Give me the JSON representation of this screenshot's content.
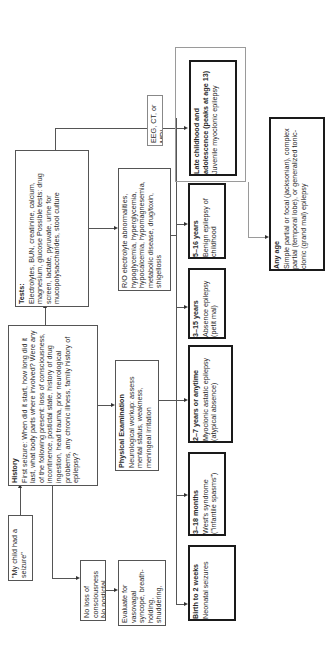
{
  "diagram": {
    "orientation": "rotated 90 degrees counterclockwise",
    "nodes": {
      "start": {
        "text": "\"My child had a seizure\""
      },
      "history": {
        "title": "History",
        "body": "First seizure: When did it start, how long did it last, what body parts where involved? Were any of the following present: loss of consciousness, incontinence, postictal state, history of drug ingestion, head trauma, prior neurological problems, any chronic illness, family history of epilepsy?"
      },
      "tests": {
        "title": "Tests:",
        "body": "Electrolytes, BUN, creatinine, calcium, magnesium, glucose Possible tests: drug screen, lactate, pyruvate, urine for mucopolysaccharides, stool culture"
      },
      "no_loss": {
        "text": "No loss of consciousness No postictal state"
      },
      "evaluate": {
        "text": "Evaluate for vasovagal syncope, breath-holding, shuddering, benign paroxysmal vertigo"
      },
      "physical_exam": {
        "title": "Physical Examination",
        "body": "Neurological workup: assess mental status, weakness, meningeal irritation"
      },
      "rule_out": {
        "text": "R/O electrolyte abnormalities, hypoglycemia, hyperglycemia, hypocalcemia, hypomagnesemia, metabolic disease, drug/toxin, shigellosis"
      },
      "imaging": {
        "text": "EEG, CT, or MRI"
      },
      "age_groups": [
        {
          "title": "Birth to 2 weeks",
          "body": "Neonatal seizures"
        },
        {
          "title": "3–18 months",
          "body": "West's syndrome (\"infantile spasms\")"
        },
        {
          "title": "2–7 years or anytime",
          "body": "Myoclonic astatic epilepsy (atypical absence)"
        },
        {
          "title": "3–15 years",
          "body": "Absence epilepsy (petit mal)"
        },
        {
          "title": "5–16 years",
          "body": "Benign epilepsy of childhood"
        },
        {
          "title": "Late childhood and adolescence (peaks at age 13)",
          "body": "Juvenile myoclonic epilepsy"
        }
      ],
      "any_age": {
        "title": "Any age",
        "body": "Simple partial or focal (jacksonian), complex partial (temporal lobe), or generalized tonic-clonic (grand mal) epilepsy"
      }
    },
    "colors": {
      "line": "#555555",
      "thick_border": "#1a1a1a",
      "background": "#ffffff"
    }
  }
}
